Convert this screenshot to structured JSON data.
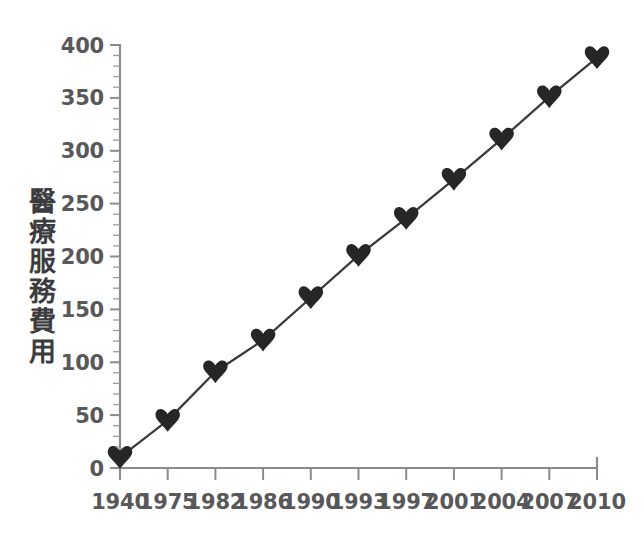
{
  "chart_data": {
    "type": "line",
    "title": "",
    "xlabel": "",
    "ylabel": "醫療服務費用",
    "categories": [
      "1940",
      "1975",
      "1982",
      "1986",
      "1990",
      "1993",
      "1997",
      "2001",
      "2004",
      "2007",
      "2010"
    ],
    "values": [
      10,
      45,
      91,
      121,
      161,
      201,
      236,
      273,
      311,
      351,
      388
    ],
    "series": [
      {
        "name": "醫療服務費用",
        "values": [
          10,
          45,
          91,
          121,
          161,
          201,
          236,
          273,
          311,
          351,
          388
        ]
      }
    ],
    "ylim": [
      0,
      400
    ],
    "ytick_labels": [
      "0",
      "50",
      "100",
      "150",
      "200",
      "250",
      "300",
      "350",
      "400"
    ],
    "ytick_values": [
      0,
      50,
      100,
      150,
      200,
      250,
      300,
      350,
      400
    ],
    "yminor_step": 10,
    "grid": false,
    "legend": "none",
    "marker": "heart",
    "marker_color": "#262628",
    "line_color": "#3a3a3c",
    "axis_color": "#8b8b8d",
    "text_color": "#58585a",
    "background": "#ffffff"
  },
  "axis": {
    "y_label_chars": [
      "醫",
      "療",
      "服",
      "務",
      "費",
      "用"
    ]
  }
}
